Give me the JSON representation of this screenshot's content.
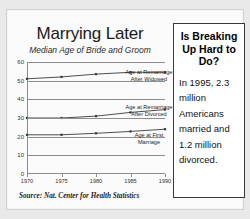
{
  "chart_data": {
    "type": "line",
    "title": "Marrying Later",
    "subtitle": "Median Age of Bride and Groom",
    "xlabel": "",
    "ylabel": "",
    "x": [
      1970,
      1975,
      1980,
      1985,
      1990
    ],
    "xticklabels": [
      "1970",
      "1975",
      "1980",
      "1985",
      "1990"
    ],
    "yticklabels": [
      "0",
      "10",
      "20",
      "30",
      "40",
      "50",
      "60"
    ],
    "yticks": [
      0,
      10,
      20,
      30,
      40,
      50,
      60
    ],
    "ylim": [
      0,
      60
    ],
    "xlim": [
      1970,
      1990
    ],
    "grid": true,
    "legend_position": "right-of-plot",
    "series": [
      {
        "name": "Age at Remarriage After Widowed",
        "values": [
          51,
          52,
          53.5,
          54.5,
          54.5
        ]
      },
      {
        "name": "Age at Remarriage After Divorced",
        "values": [
          30,
          30,
          31,
          33,
          34.5
        ]
      },
      {
        "name": "Age at First Marriage",
        "values": [
          21,
          21,
          21.8,
          22.8,
          24
        ]
      }
    ],
    "source": "Source: Nat. Center for Health Statistics"
  },
  "sidebar": {
    "headline": "Is Breaking Up Hard to Do?",
    "body": "In 1995, 2.3 million Americans married and 1.2 million divorced."
  },
  "colors": {
    "background": "#e9e9e9",
    "card": "#fbfbfb",
    "axis": "#8d8d8d",
    "line": "#3a3a3a",
    "text": "#1a1a1a",
    "box_border": "#3a3a3a"
  }
}
